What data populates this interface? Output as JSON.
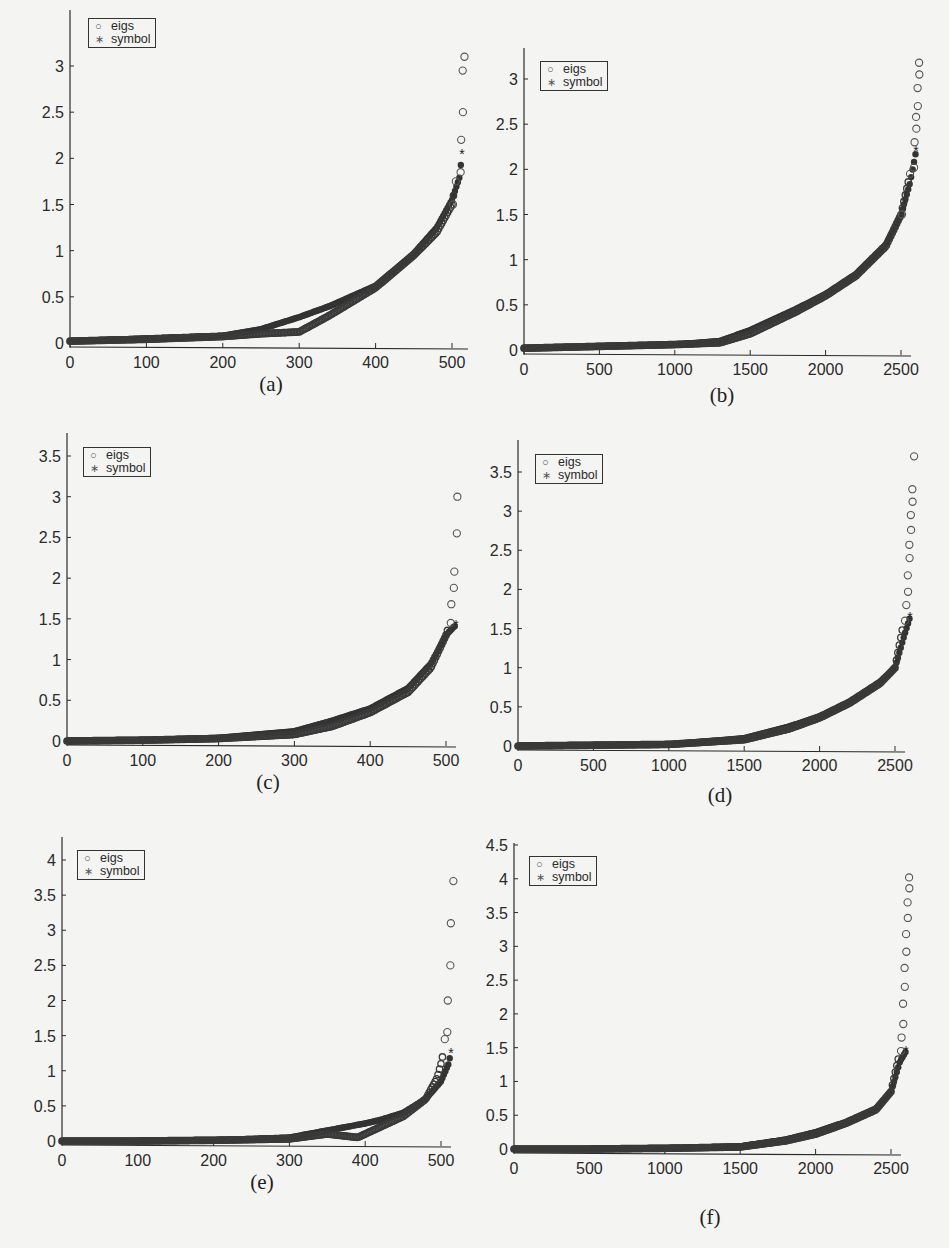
{
  "page": {
    "running_head": "",
    "legend": {
      "eigs_label": "eigs",
      "symbol_label": "symbol",
      "eigs_icon": "open-circle-marker",
      "symbol_icon": "asterisk-marker"
    },
    "colors": {
      "ink": "#2a2a2a",
      "marker_fill": "#333333",
      "background": "#f4f4f2"
    }
  },
  "panels": [
    {
      "id": "a",
      "caption": "(a)",
      "x_ticks": [
        "0",
        "100",
        "200",
        "300",
        "400",
        "500"
      ],
      "y_ticks": [
        "0",
        "0.5",
        "1",
        "1.5",
        "2",
        "2.5",
        "3"
      ]
    },
    {
      "id": "b",
      "caption": "(b)",
      "x_ticks": [
        "0",
        "500",
        "1000",
        "1500",
        "2000",
        "2500"
      ],
      "y_ticks": [
        "0",
        "0.5",
        "1",
        "1.5",
        "2",
        "2.5",
        "3"
      ]
    },
    {
      "id": "c",
      "caption": "(c)",
      "x_ticks": [
        "0",
        "100",
        "200",
        "300",
        "400",
        "500"
      ],
      "y_ticks": [
        "0",
        "0.5",
        "1",
        "1.5",
        "2",
        "2.5",
        "3",
        "3.5"
      ]
    },
    {
      "id": "d",
      "caption": "(d)",
      "x_ticks": [
        "0",
        "500",
        "1000",
        "1500",
        "2000",
        "2500"
      ],
      "y_ticks": [
        "0",
        "0.5",
        "1",
        "1.5",
        "2",
        "2.5",
        "3",
        "3.5"
      ]
    },
    {
      "id": "e",
      "caption": "(e)",
      "x_ticks": [
        "0",
        "100",
        "200",
        "300",
        "400",
        "500"
      ],
      "y_ticks": [
        "0",
        "0.5",
        "1",
        "1.5",
        "2",
        "2.5",
        "3",
        "3.5",
        "4"
      ]
    },
    {
      "id": "f",
      "caption": "(f)",
      "x_ticks": [
        "0",
        "500",
        "1000",
        "1500",
        "2000",
        "2500"
      ],
      "y_ticks": [
        "0",
        "0.5",
        "1",
        "1.5",
        "2",
        "2.5",
        "3",
        "3.5",
        "4",
        "4.5"
      ]
    }
  ],
  "chart_data": [
    {
      "panel": "a",
      "type": "scatter",
      "title": "(a)",
      "xlabel": "",
      "ylabel": "",
      "xlim": [
        0,
        515
      ],
      "ylim": [
        0,
        3.2
      ],
      "grid": false,
      "legend_position": "upper left",
      "series": [
        {
          "name": "eigs",
          "marker": "o",
          "x": [
            0,
            100,
            200,
            250,
            300,
            340,
            400,
            450,
            480,
            500,
            505,
            510,
            512,
            513,
            514,
            515
          ],
          "y": [
            0.02,
            0.04,
            0.07,
            0.1,
            0.12,
            0.3,
            0.6,
            0.95,
            1.2,
            1.5,
            1.75,
            1.85,
            2.2,
            2.5,
            2.95,
            3.1
          ]
        },
        {
          "name": "symbol",
          "marker": "*",
          "x": [
            0,
            100,
            200,
            250,
            300,
            340,
            400,
            450,
            480,
            500,
            510,
            513
          ],
          "y": [
            0.02,
            0.05,
            0.08,
            0.15,
            0.28,
            0.4,
            0.62,
            0.97,
            1.25,
            1.55,
            1.8,
            2.05
          ]
        }
      ]
    },
    {
      "panel": "b",
      "type": "scatter",
      "title": "(b)",
      "xlabel": "",
      "ylabel": "",
      "xlim": [
        0,
        2600
      ],
      "ylim": [
        0,
        3.3
      ],
      "grid": false,
      "legend_position": "upper left",
      "series": [
        {
          "name": "eigs",
          "marker": "o",
          "x": [
            0,
            500,
            1000,
            1300,
            1500,
            1800,
            2000,
            2200,
            2400,
            2500,
            2560,
            2580,
            2590,
            2595,
            2600,
            2605,
            2610,
            2615,
            2620
          ],
          "y": [
            0.02,
            0.04,
            0.06,
            0.08,
            0.18,
            0.42,
            0.6,
            0.82,
            1.15,
            1.5,
            1.95,
            2.02,
            2.3,
            2.45,
            2.58,
            2.7,
            2.9,
            3.05,
            3.18
          ]
        },
        {
          "name": "symbol",
          "marker": "*",
          "x": [
            0,
            500,
            1000,
            1300,
            1500,
            1800,
            2000,
            2200,
            2400,
            2500,
            2560,
            2600
          ],
          "y": [
            0.02,
            0.04,
            0.06,
            0.1,
            0.22,
            0.45,
            0.62,
            0.84,
            1.17,
            1.5,
            1.85,
            2.2
          ]
        }
      ]
    },
    {
      "panel": "c",
      "type": "scatter",
      "title": "(c)",
      "xlabel": "",
      "ylabel": "",
      "xlim": [
        0,
        515
      ],
      "ylim": [
        0,
        3.7
      ],
      "grid": false,
      "legend_position": "upper left",
      "series": [
        {
          "name": "eigs",
          "marker": "o",
          "x": [
            0,
            100,
            200,
            300,
            350,
            400,
            450,
            480,
            500,
            505,
            507,
            509,
            511,
            513,
            515
          ],
          "y": [
            0.0,
            0.01,
            0.03,
            0.08,
            0.18,
            0.35,
            0.6,
            0.9,
            1.3,
            1.45,
            1.68,
            1.88,
            2.08,
            2.55,
            3.0,
            3.35,
            3.6
          ]
        },
        {
          "name": "symbol",
          "marker": "*",
          "x": [
            0,
            100,
            200,
            300,
            350,
            400,
            450,
            480,
            500,
            510,
            513
          ],
          "y": [
            0.0,
            0.01,
            0.04,
            0.12,
            0.25,
            0.4,
            0.65,
            0.95,
            1.3,
            1.4,
            1.42
          ]
        }
      ]
    },
    {
      "panel": "d",
      "type": "scatter",
      "title": "(d)",
      "xlabel": "",
      "ylabel": "",
      "xlim": [
        0,
        2600
      ],
      "ylim": [
        0,
        3.8
      ],
      "grid": false,
      "legend_position": "upper left",
      "series": [
        {
          "name": "eigs",
          "marker": "o",
          "x": [
            0,
            500,
            1000,
            1500,
            1800,
            2000,
            2200,
            2400,
            2500,
            2560,
            2575,
            2580,
            2585,
            2590,
            2595,
            2600,
            2605,
            2610,
            2615,
            2620
          ],
          "y": [
            0.0,
            0.01,
            0.02,
            0.08,
            0.22,
            0.36,
            0.55,
            0.8,
            1.0,
            1.6,
            1.8,
            1.97,
            2.18,
            2.4,
            2.57,
            2.76,
            2.95,
            3.12,
            3.28,
            3.7
          ]
        },
        {
          "name": "symbol",
          "marker": "*",
          "x": [
            0,
            500,
            1000,
            1500,
            1800,
            2000,
            2200,
            2400,
            2500,
            2560,
            2600
          ],
          "y": [
            0.0,
            0.01,
            0.02,
            0.1,
            0.25,
            0.38,
            0.57,
            0.82,
            1.0,
            1.4,
            1.65
          ]
        }
      ]
    },
    {
      "panel": "e",
      "type": "scatter",
      "title": "(e)",
      "xlabel": "",
      "ylabel": "",
      "xlim": [
        0,
        515
      ],
      "ylim": [
        0,
        4.3
      ],
      "grid": false,
      "legend_position": "upper left",
      "series": [
        {
          "name": "eigs",
          "marker": "o",
          "x": [
            0,
            100,
            200,
            300,
            350,
            390,
            420,
            450,
            480,
            495,
            500,
            503,
            505,
            507,
            509,
            511,
            513,
            515
          ],
          "y": [
            0.0,
            0.0,
            0.01,
            0.03,
            0.1,
            0.05,
            0.2,
            0.35,
            0.6,
            0.9,
            1.1,
            1.25,
            1.45,
            1.55,
            2.0,
            2.5,
            3.1,
            3.7,
            4.15
          ]
        },
        {
          "name": "symbol",
          "marker": "*",
          "x": [
            0,
            100,
            200,
            300,
            350,
            400,
            420,
            450,
            480,
            500,
            510,
            513
          ],
          "y": [
            0.0,
            0.0,
            0.01,
            0.05,
            0.15,
            0.25,
            0.3,
            0.4,
            0.6,
            0.85,
            1.1,
            1.25
          ]
        }
      ]
    },
    {
      "panel": "f",
      "type": "scatter",
      "title": "(f)",
      "xlabel": "",
      "ylabel": "",
      "xlim": [
        0,
        2600
      ],
      "ylim": [
        0,
        4.5
      ],
      "grid": false,
      "legend_position": "upper left",
      "series": [
        {
          "name": "eigs",
          "marker": "o",
          "x": [
            0,
            500,
            1000,
            1500,
            1800,
            2000,
            2200,
            2400,
            2500,
            2560,
            2570,
            2575,
            2580,
            2585,
            2590,
            2595,
            2600,
            2605,
            2610,
            2615,
            2620
          ],
          "y": [
            0.0,
            0.0,
            0.01,
            0.03,
            0.12,
            0.22,
            0.38,
            0.58,
            0.85,
            1.45,
            1.65,
            1.85,
            2.15,
            2.4,
            2.68,
            2.92,
            3.18,
            3.42,
            3.65,
            3.86,
            4.02,
            4.35
          ]
        },
        {
          "name": "symbol",
          "marker": "*",
          "x": [
            0,
            500,
            1000,
            1500,
            1800,
            2000,
            2200,
            2400,
            2500,
            2560,
            2600
          ],
          "y": [
            0.0,
            0.0,
            0.01,
            0.04,
            0.14,
            0.25,
            0.4,
            0.6,
            0.85,
            1.3,
            1.45
          ]
        }
      ]
    }
  ]
}
